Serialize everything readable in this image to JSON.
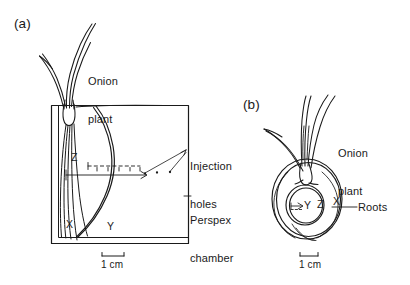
{
  "figure": {
    "type": "line-diagram",
    "background_color": "#ffffff",
    "ink_color": "#1a1a1a"
  },
  "panel_a": {
    "tag": "(a)",
    "view": "side",
    "labels": {
      "plant_line1": "Onion",
      "plant_line2": "plant",
      "injection_line1": "Injection",
      "injection_line2": "holes",
      "chamber_line1": "Perspex",
      "chamber_line2": "chamber"
    },
    "markers": {
      "z": "Z",
      "x": "X",
      "y": "Y"
    },
    "scale_bar": {
      "caption": "1 cm"
    }
  },
  "panel_b": {
    "tag": "(b)",
    "view": "plan",
    "labels": {
      "plant_line1": "Onion",
      "plant_line2": "plant",
      "roots": "Roots"
    },
    "markers": {
      "y": "Y",
      "z": "Z",
      "x": "X"
    },
    "scale_bar": {
      "caption": "1 cm"
    }
  }
}
